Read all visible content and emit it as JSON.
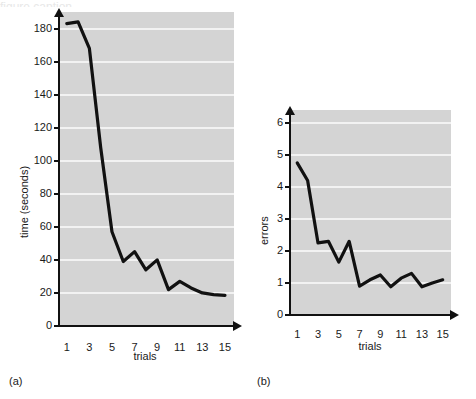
{
  "figure": {
    "background": "#ffffff",
    "plot_background": "#d4d4d4",
    "gridline_color": "#f2f2f2",
    "line_color": "#111111",
    "top_cropped_text": "figure caption"
  },
  "panels": [
    {
      "key": "a",
      "label": "(a)",
      "xlabel": "trials",
      "ylabel": "time (seconds)"
    },
    {
      "key": "b",
      "label": "(b)",
      "xlabel": "trials",
      "ylabel": "errors"
    }
  ],
  "chart_data": [
    {
      "type": "line",
      "panel": "(a)",
      "title": "",
      "xlabel": "trials",
      "ylabel": "time (seconds)",
      "x": [
        1,
        2,
        3,
        4,
        5,
        6,
        7,
        8,
        9,
        10,
        11,
        12,
        13,
        14,
        15
      ],
      "values": [
        183,
        184,
        168,
        108,
        57,
        39,
        45,
        34,
        40,
        22,
        27,
        23,
        20,
        19,
        18.5
      ],
      "series": [
        {
          "name": "time",
          "values": [
            183,
            184,
            168,
            108,
            57,
            39,
            45,
            34,
            40,
            22,
            27,
            23,
            20,
            19,
            18.5
          ]
        }
      ],
      "xlim": [
        0.4,
        15.8
      ],
      "ylim": [
        0,
        190
      ],
      "yticks": [
        0,
        20,
        40,
        60,
        80,
        100,
        120,
        140,
        160,
        180
      ],
      "xticks": [
        1,
        3,
        5,
        7,
        9,
        11,
        13,
        15
      ],
      "ytick_labels": [
        "0",
        "20",
        "40",
        "60",
        "80",
        "100",
        "120",
        "140",
        "160",
        "180"
      ],
      "xtick_labels": [
        "1",
        "3",
        "5",
        "7",
        "9",
        "11",
        "13",
        "15"
      ],
      "grid": true,
      "legend": "none"
    },
    {
      "type": "line",
      "panel": "(b)",
      "title": "",
      "xlabel": "trials",
      "ylabel": "errors",
      "x": [
        1,
        2,
        3,
        4,
        5,
        6,
        7,
        8,
        9,
        10,
        11,
        12,
        13,
        14,
        15
      ],
      "values": [
        4.75,
        4.2,
        2.25,
        2.3,
        1.65,
        2.3,
        0.9,
        1.1,
        1.25,
        0.88,
        1.15,
        1.3,
        0.88,
        1.0,
        1.1
      ],
      "series": [
        {
          "name": "errors",
          "values": [
            4.75,
            4.2,
            2.25,
            2.3,
            1.65,
            2.3,
            0.9,
            1.1,
            1.25,
            0.88,
            1.15,
            1.3,
            0.88,
            1.0,
            1.1
          ]
        }
      ],
      "xlim": [
        0.4,
        15.8
      ],
      "ylim": [
        0,
        6.4
      ],
      "yticks": [
        0,
        1,
        2,
        3,
        4,
        5,
        6
      ],
      "xticks": [
        1,
        3,
        5,
        7,
        9,
        11,
        13,
        15
      ],
      "ytick_labels": [
        "0",
        "1",
        "2",
        "3",
        "4",
        "5",
        "6"
      ],
      "xtick_labels": [
        "1",
        "3",
        "5",
        "7",
        "9",
        "11",
        "13",
        "15"
      ],
      "grid": true,
      "legend": "none"
    }
  ]
}
